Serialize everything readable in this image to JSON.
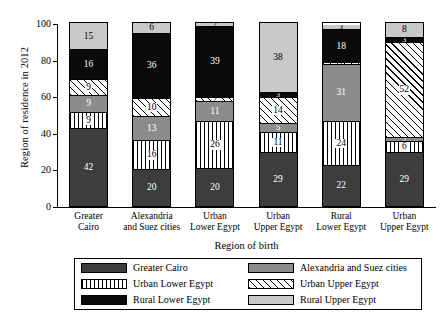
{
  "chart_data": {
    "type": "bar",
    "subtype": "stacked-percentage",
    "title": "",
    "xlabel": "Region of birth",
    "ylabel": "Region of residence in 2012",
    "ylim": [
      0,
      100
    ],
    "yticks": [
      0,
      20,
      40,
      60,
      80,
      100
    ],
    "grid": false,
    "legend_position": "bottom",
    "categories": [
      "Greater Cairo",
      "Alexandria and Suez cities",
      "Urban Lower Egypt",
      "Urban Upper Egypt",
      "Rural Lower Egypt",
      "Urban Upper Egypt"
    ],
    "category_lines": [
      [
        "Greater",
        "Cairo"
      ],
      [
        "Alexandria",
        "and Suez cities"
      ],
      [
        "Urban",
        "Lower Egypt"
      ],
      [
        "Urban",
        "Upper Egypt"
      ],
      [
        "Rural",
        "Lower Egypt"
      ],
      [
        "Urban",
        "Upper Egypt"
      ]
    ],
    "series": [
      {
        "name": "Greater Cairo",
        "fill": "dark",
        "values": [
          42,
          20,
          20,
          29,
          22,
          29
        ]
      },
      {
        "name": "Urban Lower Egypt",
        "fill": "vert",
        "values": [
          9,
          16,
          26,
          11,
          24,
          6
        ]
      },
      {
        "name": "Alexandria and Suez cities",
        "fill": "gray",
        "values": [
          9,
          13,
          11,
          5,
          31,
          2
        ]
      },
      {
        "name": "Urban Upper Egypt",
        "fill": "diag",
        "values": [
          9,
          10,
          2,
          14,
          1,
          52
        ]
      },
      {
        "name": "Rural Lower Egypt",
        "fill": "black",
        "values": [
          16,
          36,
          39,
          3,
          18,
          3
        ]
      },
      {
        "name": "Rural Upper Egypt",
        "fill": "light",
        "values": [
          15,
          6,
          2,
          38,
          3,
          8
        ]
      }
    ]
  },
  "legend": {
    "items": [
      {
        "label": "Greater Cairo",
        "fill": "dark"
      },
      {
        "label": "Alexandria and Suez cities",
        "fill": "gray"
      },
      {
        "label": "Urban Lower Egypt",
        "fill": "vert"
      },
      {
        "label": "Urban Upper Egypt",
        "fill": "diag"
      },
      {
        "label": "Rural Lower Egypt",
        "fill": "black"
      },
      {
        "label": "Rural Upper Egypt",
        "fill": "light"
      }
    ]
  },
  "colors": {
    "dark": "#3d3d3d",
    "gray": "#8c8c8c",
    "black": "#0a0a0a",
    "light": "#c9c9c9",
    "axis": "#000000",
    "background": "#ffffff"
  }
}
